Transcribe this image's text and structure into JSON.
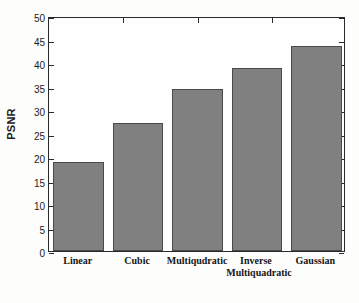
{
  "chart_data": {
    "type": "bar",
    "title": "",
    "xlabel": "",
    "ylabel": "PSNR",
    "categories": [
      "Linear",
      "Cubic",
      "Multiqudratic",
      "Inverse\nMultiquadratic",
      "Gaussian"
    ],
    "values": [
      19.0,
      27.3,
      34.5,
      39.0,
      43.7
    ],
    "ylim": [
      0,
      50
    ],
    "ytick_values": [
      0,
      5,
      10,
      15,
      20,
      25,
      30,
      35,
      40,
      45,
      50
    ],
    "ytick_labels": [
      "0",
      "5",
      "10",
      "15",
      "20",
      "25",
      "30",
      "35",
      "40",
      "45",
      "50"
    ],
    "grid": false,
    "legend": null,
    "bar_color": "#808080",
    "bar_edge_color": "#4a4a4a",
    "axis_color": "#2a2a2a",
    "background_color": "#fdfdfb"
  }
}
